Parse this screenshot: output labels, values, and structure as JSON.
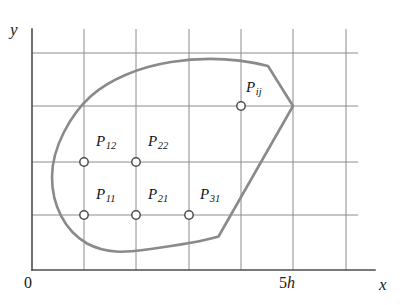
{
  "figure": {
    "title": "",
    "type": "geometry-diagram",
    "colors": {
      "background": "#ffffff",
      "grid": "#8c8c8c",
      "axis": "#595959",
      "boundary_curve": "#8a8a8a",
      "node_stroke": "#4d4d4d",
      "node_fill": "#ffffff",
      "text": "#1a1a1a"
    },
    "axes": {
      "x_label": "x",
      "y_label": "y",
      "origin_label": "0",
      "x_tick_labels": [
        {
          "text_number": "5",
          "text_symbol": "h",
          "full": "5h",
          "x_px": 293
        }
      ],
      "x_axis_y_px": 270,
      "y_axis_x_px": 32,
      "x_axis_end_px": 375,
      "y_axis_top_px": 29
    },
    "grid": {
      "spacing_px": 52.3,
      "spacing_label": "h",
      "vertical_lines_px": [
        84,
        136,
        189,
        241,
        293,
        346
      ],
      "horizontal_lines_px": [
        53,
        106,
        162,
        215
      ],
      "grid_top_px": 29,
      "grid_right_px": 358
    },
    "nodes": [
      {
        "id": "P11",
        "base": "P",
        "subscript": "11",
        "x_px": 84,
        "y_px": 215,
        "label_dx": 14,
        "label_dy": -30
      },
      {
        "id": "P21",
        "base": "P",
        "subscript": "21",
        "x_px": 136,
        "y_px": 215,
        "label_dx": 14,
        "label_dy": -30
      },
      {
        "id": "P31",
        "base": "P",
        "subscript": "31",
        "x_px": 189,
        "y_px": 215,
        "label_dx": 14,
        "label_dy": -30
      },
      {
        "id": "P12",
        "base": "P",
        "subscript": "12",
        "x_px": 84,
        "y_px": 162,
        "label_dx": 14,
        "label_dy": -30
      },
      {
        "id": "P22",
        "base": "P",
        "subscript": "22",
        "x_px": 136,
        "y_px": 162,
        "label_dx": 14,
        "label_dy": -30
      },
      {
        "id": "Pij",
        "base": "P",
        "subscript": "ij",
        "x_px": 241,
        "y_px": 106,
        "label_dx": 14,
        "label_dy": -30
      }
    ],
    "node_radius_px": 4.2,
    "boundary_path": "M 84 102 C 68 118 50 148 50 176 C 50 206 62 232 84 244 C 104 254 124 253 146 250 C 176 245 200 242 218 237 L 268 66 L 293 106 L 218 237",
    "boundary_outline": "M 268 66 C 240 59 205 57 172 62 C 140 67 110 80 92 96 C 72 113 52 146 52 176 C 52 204 64 230 86 243 C 106 253 123 252 146 250 C 172 247 200 243 218 237 L 293 106 Z"
  }
}
